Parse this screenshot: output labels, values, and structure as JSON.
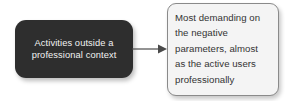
{
  "diagram": {
    "type": "flow-diagram",
    "background_color": "#ffffff",
    "nodes": [
      {
        "id": "activities-outside",
        "label": "Activities outside a\nprofessional context",
        "shape": "rounded-rectangle",
        "fill_color": "#2e2e2e",
        "text_color": "#f2f2f2",
        "has_shadow": true
      },
      {
        "id": "most-demanding",
        "label": "Most demanding on\nthe negative\nparameters, almost\nas the active users\nprofessionally",
        "shape": "rounded-rectangle",
        "fill_color": "#f4f4f4",
        "border_color": "#8a8a8a",
        "text_color": "#333333",
        "has_shadow": true
      }
    ],
    "connectors": [
      {
        "id": "arrow-1",
        "from": "activities-outside",
        "to": "most-demanding",
        "style": "solid-line-with-arrowhead",
        "color": "#4a4a4a",
        "label": ""
      }
    ]
  }
}
